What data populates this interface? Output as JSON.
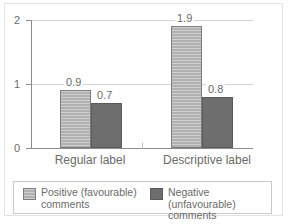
{
  "chart_data": {
    "type": "bar",
    "title": "",
    "subtitle": "",
    "xlabel": "",
    "ylabel": "",
    "categories": [
      "Regular label",
      "Descriptive label"
    ],
    "series": [
      {
        "name": "Positive (favourable) comments",
        "legend_label": "Positive (favourable)\ncomments",
        "color": "#b1b1b1",
        "values": [
          0.9,
          1.9
        ],
        "value_labels": [
          "0.9",
          "1.9"
        ]
      },
      {
        "name": "Negative (unfavourable) comments",
        "legend_label": "Negative (unfavourable)\ncomments",
        "color": "#6e6e6e",
        "values": [
          0.7,
          0.8
        ],
        "value_labels": [
          "0.7",
          "0.8"
        ]
      }
    ],
    "ylim": [
      0,
      2
    ],
    "yticks": [
      0,
      1,
      2
    ],
    "ytick_labels": [
      "0",
      "1",
      "2"
    ],
    "grid": true,
    "gridlines_at": [
      1,
      2
    ],
    "legend_position": "bottom"
  }
}
